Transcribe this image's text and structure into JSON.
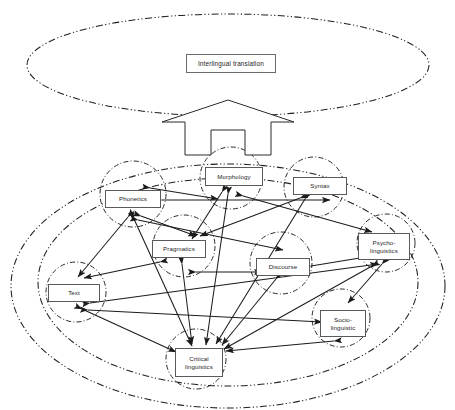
{
  "diagram": {
    "title": "Interlingual translation",
    "stroke_color": "#222222",
    "box_border_color": "#5a5a5a",
    "background": "#ffffff",
    "outer_top_region_label": "Interlingual translation",
    "top_box": {
      "label": "Interlingual translation",
      "x": 186,
      "y": 54,
      "w": 90,
      "h": 19
    },
    "big_arrow": {
      "name": "upward-block-arrow",
      "direction": "up"
    },
    "ellipses": [
      {
        "name": "interlingual-translation-ellipse",
        "cx": 228,
        "cy": 65,
        "rx": 201,
        "ry": 51,
        "dash": "dashdotdot"
      },
      {
        "name": "linguistics-outer-ellipse",
        "cx": 228,
        "cy": 286,
        "rx": 217,
        "ry": 122,
        "dash": "dashdotdot"
      },
      {
        "name": "linguistics-inner-ellipse",
        "cx": 228,
        "cy": 282,
        "rx": 190,
        "ry": 104,
        "dash": "dashdotdot"
      }
    ],
    "nodes": [
      {
        "id": "phonetics",
        "label": "Phonetics",
        "box": {
          "x": 105,
          "y": 190,
          "w": 56,
          "h": 18
        },
        "circle": {
          "cx": 133,
          "cy": 194,
          "r": 33
        }
      },
      {
        "id": "morphology",
        "label": "Morphology",
        "box": {
          "x": 205,
          "y": 167,
          "w": 58,
          "h": 19
        },
        "circle": {
          "cx": 231,
          "cy": 178,
          "r": 31
        }
      },
      {
        "id": "syntax",
        "label": "Syntax",
        "box": {
          "x": 293,
          "y": 177,
          "w": 54,
          "h": 18
        },
        "circle": {
          "cx": 314,
          "cy": 187,
          "r": 30
        }
      },
      {
        "id": "pragmatics",
        "label": "Pragmatics",
        "box": {
          "x": 152,
          "y": 240,
          "w": 54,
          "h": 18
        },
        "circle": {
          "cx": 184,
          "cy": 246,
          "r": 31
        }
      },
      {
        "id": "discourse",
        "label": "Discourse",
        "box": {
          "x": 256,
          "y": 258,
          "w": 54,
          "h": 18
        },
        "circle": {
          "cx": 281,
          "cy": 263,
          "r": 31
        }
      },
      {
        "id": "psycholinguistics",
        "label": "Psycho-\nlinguistics",
        "box": {
          "x": 358,
          "y": 233,
          "w": 52,
          "h": 27
        },
        "circle": {
          "cx": 386,
          "cy": 243,
          "r": 29
        }
      },
      {
        "id": "text",
        "label": "Text",
        "box": {
          "x": 48,
          "y": 284,
          "w": 52,
          "h": 18
        },
        "circle": {
          "cx": 76,
          "cy": 292,
          "r": 30
        }
      },
      {
        "id": "sociolinguistic",
        "label": "Socio-\nlinguistic",
        "box": {
          "x": 320,
          "y": 310,
          "w": 46,
          "h": 27
        },
        "circle": {
          "cx": 341,
          "cy": 318,
          "r": 29
        }
      },
      {
        "id": "criticallinguistics",
        "label": "Critical\nlinguistics",
        "box": {
          "x": 175,
          "y": 348,
          "w": 48,
          "h": 29
        },
        "circle": {
          "cx": 196,
          "cy": 359,
          "r": 30
        }
      }
    ],
    "edges": [
      {
        "from": "phonetics",
        "to": "morphology",
        "arrow": "both"
      },
      {
        "from": "phonetics",
        "to": "syntax",
        "arrow": "both"
      },
      {
        "from": "phonetics",
        "to": "pragmatics",
        "arrow": "both"
      },
      {
        "from": "phonetics",
        "to": "discourse",
        "arrow": "both"
      },
      {
        "from": "phonetics",
        "to": "text",
        "arrow": "both"
      },
      {
        "from": "phonetics",
        "to": "criticallinguistics",
        "arrow": "both"
      },
      {
        "from": "morphology",
        "to": "pragmatics",
        "arrow": "both"
      },
      {
        "from": "morphology",
        "to": "psycholinguistics",
        "arrow": "both"
      },
      {
        "from": "morphology",
        "to": "criticallinguistics",
        "arrow": "both"
      },
      {
        "from": "syntax",
        "to": "pragmatics",
        "arrow": "both"
      },
      {
        "from": "syntax",
        "to": "criticallinguistics",
        "arrow": "both"
      },
      {
        "from": "pragmatics",
        "to": "text",
        "arrow": "both"
      },
      {
        "from": "pragmatics",
        "to": "discourse",
        "arrow": "both"
      },
      {
        "from": "pragmatics",
        "to": "criticallinguistics",
        "arrow": "both"
      },
      {
        "from": "discourse",
        "to": "psycholinguistics",
        "arrow": "both"
      },
      {
        "from": "discourse",
        "to": "criticallinguistics",
        "arrow": "both"
      },
      {
        "from": "text",
        "to": "psycholinguistics",
        "arrow": "both"
      },
      {
        "from": "text",
        "to": "sociolinguistic",
        "arrow": "both"
      },
      {
        "from": "text",
        "to": "criticallinguistics",
        "arrow": "both"
      },
      {
        "from": "psycholinguistics",
        "to": "criticallinguistics",
        "arrow": "both"
      },
      {
        "from": "psycholinguistics",
        "to": "sociolinguistic",
        "arrow": "both"
      },
      {
        "from": "sociolinguistic",
        "to": "criticallinguistics",
        "arrow": "both"
      }
    ]
  }
}
